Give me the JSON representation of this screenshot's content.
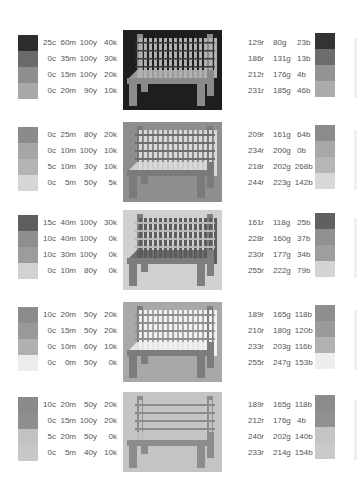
{
  "sections": [
    {
      "id": 1,
      "top": 30,
      "background": "#1e1e1e",
      "bench_color": "#8a8a8a",
      "slat_color": "#b0b0b0",
      "line_color": "#3a3a3a",
      "left_swatches": [
        "#2e2e2e",
        "#6a6a6a",
        "#8e8e8e",
        "#a8a8a8"
      ],
      "cmyk": [
        {
          "c": "25c",
          "m": "60m",
          "y": "100y",
          "k": "40k"
        },
        {
          "c": "0c",
          "m": "35m",
          "y": "100y",
          "k": "30k"
        },
        {
          "c": "0c",
          "m": "15m",
          "y": "100y",
          "k": "20k"
        },
        {
          "c": "0c",
          "m": "20m",
          "y": "90y",
          "k": "10k"
        }
      ],
      "rgb": [
        {
          "r": "129r",
          "g": "80g",
          "b": "23b"
        },
        {
          "r": "186r",
          "g": "131g",
          "b": "13b"
        },
        {
          "r": "212r",
          "g": "176g",
          "b": "4b"
        },
        {
          "r": "231r",
          "g": "185g",
          "b": "46b"
        }
      ],
      "right_swatches": [
        "#333333",
        "#6c6c6c",
        "#949494",
        "#ababab"
      ]
    },
    {
      "id": 2,
      "top": 122,
      "background": "#8e8e8e",
      "bench_color": "#7a7a7a",
      "slat_color": "#d8d8d8",
      "line_color": "#6e6e6e",
      "left_swatches": [
        "#8a8a8a",
        "#a6a6a6",
        "#b4b4b4",
        "#d6d6d6"
      ],
      "cmyk": [
        {
          "c": "0c",
          "m": "25m",
          "y": "80y",
          "k": "20k"
        },
        {
          "c": "0c",
          "m": "10m",
          "y": "100y",
          "k": "10k"
        },
        {
          "c": "5c",
          "m": "10m",
          "y": "30y",
          "k": "10k"
        },
        {
          "c": "0c",
          "m": "5m",
          "y": "50y",
          "k": "5k"
        }
      ],
      "rgb": [
        {
          "r": "209r",
          "g": "161g",
          "b": "64b"
        },
        {
          "r": "234r",
          "g": "200g",
          "b": "0b"
        },
        {
          "r": "218r",
          "g": "202g",
          "b": "268b"
        },
        {
          "r": "244r",
          "g": "223g",
          "b": "142b"
        }
      ],
      "right_swatches": [
        "#8c8c8c",
        "#a8a8a8",
        "#b6b6b6",
        "#d8d8d8"
      ]
    },
    {
      "id": 3,
      "top": 210,
      "background": "#d0d0d0",
      "bench_color": "#7e7e7e",
      "slat_color": "#5c5c5c",
      "line_color": "#b8b8b8",
      "left_swatches": [
        "#5e5e5e",
        "#8e8e8e",
        "#9c9c9c",
        "#d2d2d2"
      ],
      "cmyk": [
        {
          "c": "15c",
          "m": "40m",
          "y": "100y",
          "k": "30k"
        },
        {
          "c": "10c",
          "m": "40m",
          "y": "100y",
          "k": "0k"
        },
        {
          "c": "10c",
          "m": "30m",
          "y": "100y",
          "k": "0k"
        },
        {
          "c": "0c",
          "m": "10m",
          "y": "80y",
          "k": "0k"
        }
      ],
      "rgb": [
        {
          "r": "161r",
          "g": "118g",
          "b": "25b"
        },
        {
          "r": "228r",
          "g": "160g",
          "b": "37b"
        },
        {
          "r": "230r",
          "g": "177g",
          "b": "34b"
        },
        {
          "r": "255r",
          "g": "222g",
          "b": "79b"
        }
      ],
      "right_swatches": [
        "#606060",
        "#909090",
        "#9e9e9e",
        "#d4d4d4"
      ]
    },
    {
      "id": 4,
      "top": 302,
      "background": "#a8a8a8",
      "bench_color": "#7c7c7c",
      "slat_color": "#f0f0f0",
      "line_color": "#8e8e8e",
      "left_swatches": [
        "#8c8c8c",
        "#999999",
        "#b0b0b0",
        "#ececec"
      ],
      "cmyk": [
        {
          "c": "10c",
          "m": "20m",
          "y": "50y",
          "k": "20k"
        },
        {
          "c": "0c",
          "m": "15m",
          "y": "50y",
          "k": "20k"
        },
        {
          "c": "0c",
          "m": "10m",
          "y": "60y",
          "k": "10k"
        },
        {
          "c": "0c",
          "m": "0m",
          "y": "50y",
          "k": "0k"
        }
      ],
      "rgb": [
        {
          "r": "189r",
          "g": "165g",
          "b": "118b"
        },
        {
          "r": "210r",
          "g": "180g",
          "b": "120b"
        },
        {
          "r": "233r",
          "g": "203g",
          "b": "116b"
        },
        {
          "r": "255r",
          "g": "247g",
          "b": "153b"
        }
      ],
      "right_swatches": [
        "#8e8e8e",
        "#9a9a9a",
        "#b2b2b2",
        "#eeeeee"
      ]
    },
    {
      "id": 5,
      "top": 392,
      "background": "#c4c4c4",
      "bench_color": "#8c8c8c",
      "slat_color": "#c4c4c4",
      "line_color": "#8c8c8c",
      "left_swatches": [
        "#8a8a8a",
        "#8e8e8e",
        "#c2c2c2",
        "#c8c8c8"
      ],
      "cmyk": [
        {
          "c": "10c",
          "m": "20m",
          "y": "50y",
          "k": "20k"
        },
        {
          "c": "0c",
          "m": "15m",
          "y": "100y",
          "k": "20k"
        },
        {
          "c": "5c",
          "m": "20m",
          "y": "50y",
          "k": "0k"
        },
        {
          "c": "0c",
          "m": "5m",
          "y": "40y",
          "k": "10k"
        }
      ],
      "rgb": [
        {
          "r": "189r",
          "g": "165g",
          "b": "118b"
        },
        {
          "r": "212r",
          "g": "176g",
          "b": "4b"
        },
        {
          "r": "240r",
          "g": "202g",
          "b": "140b"
        },
        {
          "r": "233r",
          "g": "214g",
          "b": "154b"
        }
      ],
      "right_swatches": [
        "#8c8c8c",
        "#909090",
        "#c4c4c4",
        "#cacaca"
      ]
    }
  ]
}
